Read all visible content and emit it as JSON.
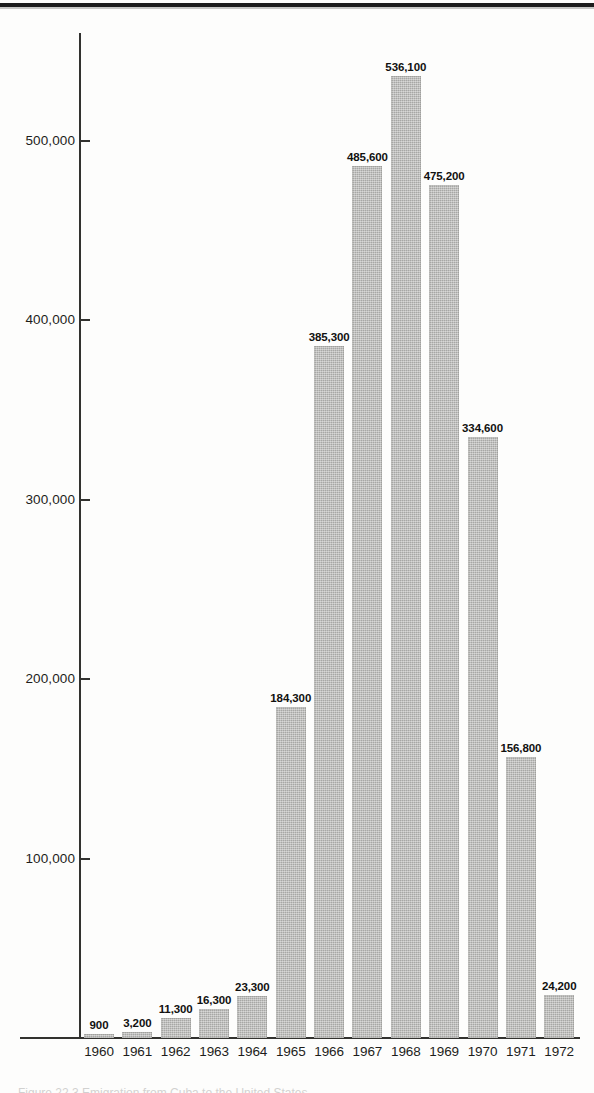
{
  "page": {
    "background_color": "#fdfdfc",
    "rule_color": "#1c1c1c",
    "caption_remnant": "Figure 22.3  Emigration from Cuba to the United States"
  },
  "axis": {
    "line_color": "#32322f",
    "y_ticks": [
      {
        "label": "100,000",
        "value": 100000
      },
      {
        "label": "200,000",
        "value": 200000
      },
      {
        "label": "300,000",
        "value": 300000
      },
      {
        "label": "400,000",
        "value": 400000
      },
      {
        "label": "500,000",
        "value": 500000
      }
    ]
  },
  "chart_data": {
    "type": "bar",
    "title": "",
    "subtitle": "",
    "xlabel": "",
    "ylabel": "",
    "categories": [
      "1960",
      "1961",
      "1962",
      "1963",
      "1964",
      "1965",
      "1966",
      "1967",
      "1968",
      "1969",
      "1970",
      "1971",
      "1972"
    ],
    "values": [
      900,
      3200,
      11300,
      16300,
      23300,
      184300,
      385300,
      485600,
      536100,
      475200,
      334600,
      156800,
      24200
    ],
    "value_labels": [
      "900",
      "3,200",
      "11,300",
      "16,300",
      "23,300",
      "184,300",
      "385,300",
      "485,600",
      "536,100",
      "475,200",
      "334,600",
      "156,800",
      "24,200"
    ],
    "ylim": [
      0,
      560000
    ],
    "xlim_labels": [
      "1960",
      "1972"
    ],
    "grid": false,
    "legend": null,
    "bar_color": "#b6b6b4",
    "label_color": "#111110",
    "tick_labels_y": [
      "100,000",
      "200,000",
      "300,000",
      "400,000",
      "500,000"
    ]
  }
}
